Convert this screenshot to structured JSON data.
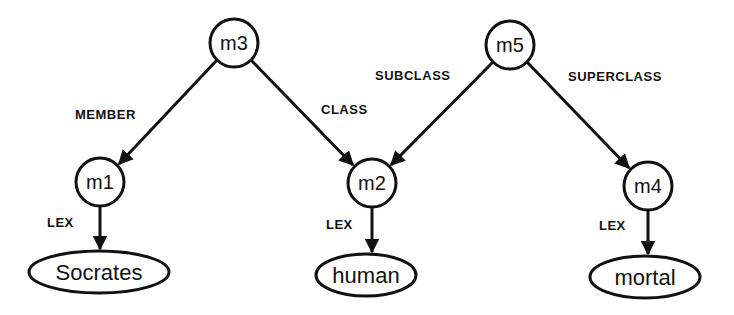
{
  "diagram": {
    "type": "semantic-network",
    "nodes": {
      "m3": {
        "label": "m3",
        "x": 234,
        "y": 43,
        "r": 24
      },
      "m5": {
        "label": "m5",
        "x": 510,
        "y": 45,
        "r": 24
      },
      "m1": {
        "label": "m1",
        "x": 100,
        "y": 182,
        "r": 24
      },
      "m2": {
        "label": "m2",
        "x": 372,
        "y": 183,
        "r": 24
      },
      "m4": {
        "label": "m4",
        "x": 648,
        "y": 186,
        "r": 24
      }
    },
    "leaves": {
      "socrates": {
        "label": "Socrates",
        "x": 99,
        "y": 272,
        "rx": 70,
        "ry": 21
      },
      "human": {
        "label": "human",
        "x": 366,
        "y": 275,
        "rx": 50,
        "ry": 21
      },
      "mortal": {
        "label": "mortal",
        "x": 645,
        "y": 277,
        "rx": 55,
        "ry": 21
      }
    },
    "edge_labels": {
      "member": "MEMBER",
      "class": "CLASS",
      "subclass": "SUBCLASS",
      "superclass": "SUPERCLASS",
      "lex1": "LEX",
      "lex2": "LEX",
      "lex3": "LEX"
    },
    "edges": [
      {
        "from": "m3",
        "to": "m1",
        "label": "MEMBER"
      },
      {
        "from": "m3",
        "to": "m2",
        "label": "CLASS"
      },
      {
        "from": "m5",
        "to": "m2",
        "label": "SUBCLASS"
      },
      {
        "from": "m5",
        "to": "m4",
        "label": "SUPERCLASS"
      },
      {
        "from": "m1",
        "to": "Socrates",
        "label": "LEX"
      },
      {
        "from": "m2",
        "to": "human",
        "label": "LEX"
      },
      {
        "from": "m4",
        "to": "mortal",
        "label": "LEX"
      }
    ],
    "colors": {
      "stroke": "#111111",
      "background": "#ffffff"
    }
  }
}
